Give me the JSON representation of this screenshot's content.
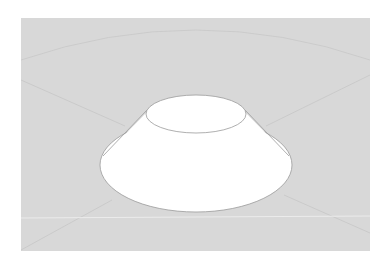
{
  "diagram": {
    "type": "truncated-cone-frustum",
    "colors": {
      "page_background": "#ffffff",
      "panel_background": "#d8d8d8",
      "shape_fill": "#ffffff",
      "outline": "#9a9a9a",
      "guide_lines": "#c6c6c6",
      "horizon_line": "#ececec"
    },
    "panel": {
      "x": 21,
      "y": 18,
      "width": 349,
      "height": 233
    },
    "frustum": {
      "top_ellipse": {
        "cx": 196,
        "cy": 114,
        "rx": 50,
        "ry": 19
      },
      "base_ellipse": {
        "cx": 196,
        "cy": 165,
        "rx": 96,
        "ry": 47
      }
    }
  }
}
